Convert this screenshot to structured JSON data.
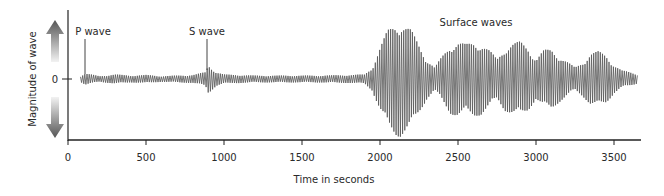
{
  "chart_data": {
    "type": "line",
    "title": "",
    "xlabel": "Time in seconds",
    "ylabel": "Magnitude of wave",
    "xlim": [
      0,
      3650
    ],
    "x_ticks": [
      0,
      500,
      1000,
      1500,
      2000,
      2500,
      3000,
      3500
    ],
    "y_ticks": [
      0
    ],
    "y_tick_labels": [
      "0"
    ],
    "grid": false,
    "legend": null,
    "annotations": [
      {
        "label": "P wave",
        "x": 110
      },
      {
        "label": "S wave",
        "x": 900
      },
      {
        "label": "Surface waves",
        "x": 2650
      }
    ],
    "series": [
      {
        "name": "Seismogram amplitude envelope (relative, 0-1)",
        "x": [
          80,
          110,
          200,
          300,
          400,
          500,
          600,
          700,
          800,
          880,
          900,
          950,
          1000,
          1100,
          1200,
          1400,
          1600,
          1800,
          1900,
          1950,
          2000,
          2050,
          2100,
          2130,
          2200,
          2250,
          2300,
          2350,
          2400,
          2450,
          2500,
          2550,
          2600,
          2650,
          2700,
          2750,
          2800,
          2850,
          2900,
          2950,
          3000,
          3050,
          3100,
          3150,
          3200,
          3250,
          3300,
          3350,
          3400,
          3450,
          3500,
          3550,
          3600,
          3650
        ],
        "values": [
          0.05,
          0.1,
          0.05,
          0.08,
          0.06,
          0.07,
          0.05,
          0.06,
          0.07,
          0.12,
          0.25,
          0.12,
          0.08,
          0.07,
          0.06,
          0.06,
          0.06,
          0.07,
          0.08,
          0.2,
          0.55,
          0.85,
          0.98,
          1.0,
          0.85,
          0.6,
          0.35,
          0.2,
          0.4,
          0.6,
          0.65,
          0.6,
          0.65,
          0.62,
          0.5,
          0.35,
          0.55,
          0.62,
          0.65,
          0.55,
          0.35,
          0.5,
          0.52,
          0.4,
          0.3,
          0.2,
          0.3,
          0.45,
          0.48,
          0.42,
          0.25,
          0.15,
          0.12,
          0.08
        ]
      }
    ]
  }
}
